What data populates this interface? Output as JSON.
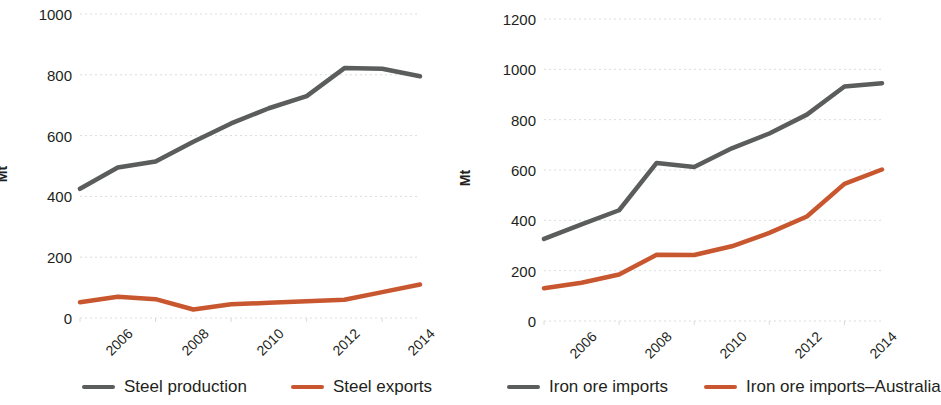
{
  "colors": {
    "series_gray": "#5a5d5c",
    "series_orange": "#c8572f",
    "grid": "#d8dce0",
    "text": "#231f20",
    "background": "#ffffff"
  },
  "charts": [
    {
      "id": "steel-chart",
      "ylabel": "Mt",
      "legend": [
        {
          "label": "Steel production",
          "color": "#5a5d5c"
        },
        {
          "label": "Steel exports",
          "color": "#c8572f"
        }
      ]
    },
    {
      "id": "iron-ore-chart",
      "ylabel": "Mt",
      "legend": [
        {
          "label": "Iron ore imports",
          "color": "#5a5d5c"
        },
        {
          "label": "Iron ore imports–Australia",
          "color": "#c8572f"
        }
      ]
    }
  ],
  "chart_data": [
    {
      "type": "line",
      "title": "",
      "xlabel": "",
      "ylabel": "Mt",
      "x": [
        2006,
        2007,
        2008,
        2009,
        2010,
        2011,
        2012,
        2013,
        2014,
        2015
      ],
      "categories": [
        "2006",
        "2007",
        "2008",
        "2009",
        "2010",
        "2011",
        "2012",
        "2013",
        "2014",
        "2015"
      ],
      "xtick_labels": [
        "2006",
        "2008",
        "2010",
        "2012",
        "2014"
      ],
      "xtick_values": [
        2006,
        2008,
        2010,
        2012,
        2014
      ],
      "ytick_labels": [
        "0",
        "200",
        "400",
        "600",
        "800",
        "1000"
      ],
      "ytick_values": [
        0,
        200,
        400,
        600,
        800,
        1000
      ],
      "ylim": [
        0,
        1000
      ],
      "xlim": [
        2006,
        2015
      ],
      "grid": true,
      "legend_position": "bottom",
      "series": [
        {
          "name": "Steel production",
          "color": "#5a5d5c",
          "values": [
            425,
            495,
            515,
            580,
            640,
            690,
            730,
            822,
            820,
            795
          ]
        },
        {
          "name": "Steel exports",
          "color": "#c8572f",
          "values": [
            52,
            70,
            62,
            28,
            45,
            50,
            55,
            60,
            85,
            110
          ]
        }
      ]
    },
    {
      "type": "line",
      "title": "",
      "xlabel": "",
      "ylabel": "Mt",
      "x": [
        2006,
        2007,
        2008,
        2009,
        2010,
        2011,
        2012,
        2013,
        2014,
        2015
      ],
      "categories": [
        "2006",
        "2007",
        "2008",
        "2009",
        "2010",
        "2011",
        "2012",
        "2013",
        "2014",
        "2015"
      ],
      "xtick_labels": [
        "2006",
        "2008",
        "2010",
        "2012",
        "2014"
      ],
      "xtick_values": [
        2006,
        2008,
        2010,
        2012,
        2014
      ],
      "ytick_labels": [
        "0",
        "200",
        "400",
        "600",
        "800",
        "1000",
        "1200"
      ],
      "ytick_values": [
        0,
        200,
        400,
        600,
        800,
        1000,
        1200
      ],
      "ylim": [
        0,
        1200
      ],
      "xlim": [
        2006,
        2015
      ],
      "grid": true,
      "legend_position": "bottom",
      "series": [
        {
          "name": "Iron ore imports",
          "color": "#5a5d5c",
          "values": [
            326,
            384,
            440,
            628,
            612,
            686,
            745,
            820,
            932,
            945
          ]
        },
        {
          "name": "Iron ore imports–Australia",
          "color": "#c8572f",
          "values": [
            130,
            152,
            185,
            263,
            262,
            297,
            350,
            415,
            545,
            602
          ]
        }
      ]
    }
  ]
}
